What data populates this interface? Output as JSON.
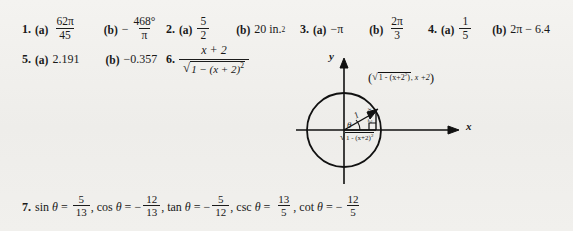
{
  "page": {
    "background_color": "#f2f1ee",
    "text_color": "#191919",
    "kind": "textbook-answer-key"
  },
  "answers": [
    {
      "number": "1.",
      "parts": [
        {
          "label": "(a)",
          "numerator": "62π",
          "denominator": "45"
        },
        {
          "label": "(b)",
          "sign": "−",
          "numerator": "468°",
          "denominator": "π"
        }
      ]
    },
    {
      "number": "2.",
      "parts": [
        {
          "label": "(a)",
          "numerator": "5",
          "denominator": "2"
        },
        {
          "label": "(b)",
          "value": "20 in.",
          "exponent": "2"
        }
      ]
    },
    {
      "number": "3.",
      "parts": [
        {
          "label": "(a)",
          "value": "−π"
        },
        {
          "label": "(b)",
          "numerator": "2π",
          "denominator": "3"
        }
      ]
    },
    {
      "number": "4.",
      "parts": [
        {
          "label": "(a)",
          "numerator": "1",
          "denominator": "5"
        },
        {
          "label": "(b)",
          "value": "2π − 6.4"
        }
      ]
    },
    {
      "number": "5.",
      "parts": [
        {
          "label": "(a)",
          "value": "2.191"
        },
        {
          "label": "(b)",
          "value": "−0.357"
        }
      ]
    },
    {
      "number": "6.",
      "expression": {
        "numerator": "x + 2",
        "denominator_radicand": "1 − (x + 2)",
        "denominator_exponent": "2",
        "radical_symbol": "√"
      }
    },
    {
      "number": "7.",
      "trig_values": [
        {
          "function": "sin",
          "variable": "θ",
          "numerator": "5",
          "denominator": "13",
          "sign": ""
        },
        {
          "function": "cos",
          "variable": "θ",
          "numerator": "12",
          "denominator": "13",
          "sign": "−"
        },
        {
          "function": "tan",
          "variable": "θ",
          "numerator": "5",
          "denominator": "12",
          "sign": "−"
        },
        {
          "function": "csc",
          "variable": "θ",
          "numerator": "13",
          "denominator": "5",
          "sign": ""
        },
        {
          "function": "cot",
          "variable": "θ",
          "numerator": "12",
          "denominator": "5",
          "sign": "−"
        }
      ],
      "separator": ","
    }
  ],
  "figure": {
    "name": "unit-circle-right-triangle",
    "x_axis_label": "x",
    "y_axis_label": "y",
    "angle_label": "θ",
    "hypotenuse_label": "1",
    "vertical_leg_label": "x + 2",
    "horizontal_leg_label": "√1 − (x + 2)²",
    "point_label": "(√1 − (x+2)², x +2)",
    "point_label_parts": {
      "open": "(",
      "radical": "√",
      "radicand": "1 - (x+2",
      "radicand_exp": "2",
      "comma": ", ",
      "second_coord": "x +2",
      "close": ")"
    },
    "circle_radius_px": 37,
    "stroke_color": "#111111"
  }
}
